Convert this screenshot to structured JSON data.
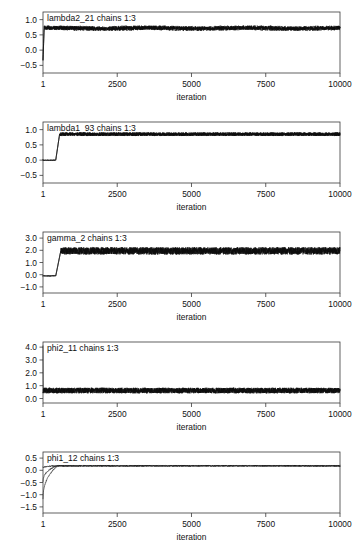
{
  "figure": {
    "kind": "mcmc-trace-panels",
    "panel_count": 5,
    "background_color": "#ffffff",
    "line_color": "#0d0d0d",
    "axis_color": "#3a3a3a"
  },
  "chart_data": [
    {
      "type": "line",
      "title": "lambda2_21 chains 1:3",
      "xlabel": "iteration",
      "ylabel": "",
      "xlim": [
        1,
        10000
      ],
      "ylim": [
        -0.75,
        1.25
      ],
      "xticks": [
        1,
        2500,
        5000,
        7500,
        10000
      ],
      "xtick_labels": [
        "1",
        "2500",
        "5000",
        "7500",
        "10000"
      ],
      "yticks": [
        -0.5,
        0.0,
        0.5,
        1.0
      ],
      "ytick_labels": [
        "-0.5",
        "0.0",
        "0.5",
        "1.0"
      ],
      "grid": false,
      "legend": null,
      "series": [
        {
          "name": "chains 1:3",
          "description": "starts near -0.35 at iteration 1, jumps to ~0.72 within first 150 iterations, then noisy stationary band centered ~0.72 with amplitude ~0.07 for the remainder",
          "burnin_start": -0.35,
          "stationary_mean": 0.72,
          "stationary_noise": 0.07
        }
      ]
    },
    {
      "type": "line",
      "title": "lambda1_93 chains 1:3",
      "xlabel": "iteration",
      "ylabel": "",
      "xlim": [
        1,
        10000
      ],
      "ylim": [
        -0.75,
        1.25
      ],
      "xticks": [
        1,
        2500,
        5000,
        7500,
        10000
      ],
      "xtick_labels": [
        "1",
        "2500",
        "5000",
        "7500",
        "10000"
      ],
      "yticks": [
        -0.5,
        0.0,
        0.5,
        1.0
      ],
      "ytick_labels": [
        "-0.5",
        "0.0",
        "0.5",
        "1.0"
      ],
      "grid": false,
      "legend": null,
      "series": [
        {
          "name": "chains 1:3",
          "description": "flat near 0.0 for first ~450 iterations, then sharp rise to stationary band centered ~0.85 with amplitude ~0.06",
          "burnin_start": 0.0,
          "burnin_end_iter": 450,
          "stationary_mean": 0.85,
          "stationary_noise": 0.06
        }
      ]
    },
    {
      "type": "line",
      "title": "gamma_2 chains 1:3",
      "xlabel": "iteration",
      "ylabel": "",
      "xlim": [
        1,
        10000
      ],
      "ylim": [
        -1.5,
        3.5
      ],
      "xticks": [
        1,
        2500,
        5000,
        7500,
        10000
      ],
      "xtick_labels": [
        "1",
        "2500",
        "5000",
        "7500",
        "10000"
      ],
      "yticks": [
        -1.0,
        0.0,
        1.0,
        2.0,
        3.0
      ],
      "ytick_labels": [
        "-1.0",
        "0.0",
        "1.0",
        "2.0",
        "3.0"
      ],
      "grid": false,
      "legend": null,
      "series": [
        {
          "name": "chains 1:3",
          "description": "flat near -0.1 for first ~450 iterations, then jumps to stationary band centered ~1.95 with amplitude ~0.30",
          "burnin_start": -0.1,
          "burnin_end_iter": 450,
          "stationary_mean": 1.95,
          "stationary_noise": 0.3
        }
      ]
    },
    {
      "type": "line",
      "title": "phi2_11 chains 1:3",
      "xlabel": "iteration",
      "ylabel": "",
      "xlim": [
        1,
        10000
      ],
      "ylim": [
        -0.35,
        4.4
      ],
      "xticks": [
        1,
        2500,
        5000,
        7500,
        10000
      ],
      "xtick_labels": [
        "1",
        "2500",
        "5000",
        "7500",
        "10000"
      ],
      "yticks": [
        0.0,
        1.0,
        2.0,
        3.0,
        4.0
      ],
      "ytick_labels": [
        "0.0",
        "1.0",
        "2.0",
        "3.0",
        "4.0"
      ],
      "grid": false,
      "legend": null,
      "series": [
        {
          "name": "chains 1:3",
          "description": "single tall initial spike reaching ~4.1 at iteration 1, then settles immediately into noisy band centered ~0.62 with amplitude ~0.22",
          "initial_spike": 4.1,
          "stationary_mean": 0.62,
          "stationary_noise": 0.22
        }
      ]
    },
    {
      "type": "line",
      "title": "phi1_12 chains 1:3",
      "xlabel": "iteration",
      "ylabel": "",
      "xlim": [
        1,
        10000
      ],
      "ylim": [
        -1.75,
        0.75
      ],
      "xticks": [
        1,
        2500,
        5000,
        7500,
        10000
      ],
      "xtick_labels": [
        "1",
        "2500",
        "5000",
        "7500",
        "10000"
      ],
      "yticks": [
        -1.5,
        -1.0,
        -0.5,
        0.0,
        0.5
      ],
      "ytick_labels": [
        "-1.5",
        "-1.0",
        "-0.5",
        "0.0",
        "0.5"
      ],
      "grid": false,
      "legend": null,
      "series": [
        {
          "name": "chain 1",
          "description": "starts near 0.1 and converges quickly to 0.18",
          "start": 0.1,
          "stationary_mean": 0.18
        },
        {
          "name": "chain 2",
          "description": "starts near -0.55, rises within ~400 iterations to join 0.18",
          "start": -0.55,
          "stationary_mean": 0.18
        },
        {
          "name": "chain 3",
          "description": "starts near -1.35, rises within ~400 iterations to join 0.18",
          "start": -1.35,
          "stationary_mean": 0.18
        }
      ]
    }
  ]
}
